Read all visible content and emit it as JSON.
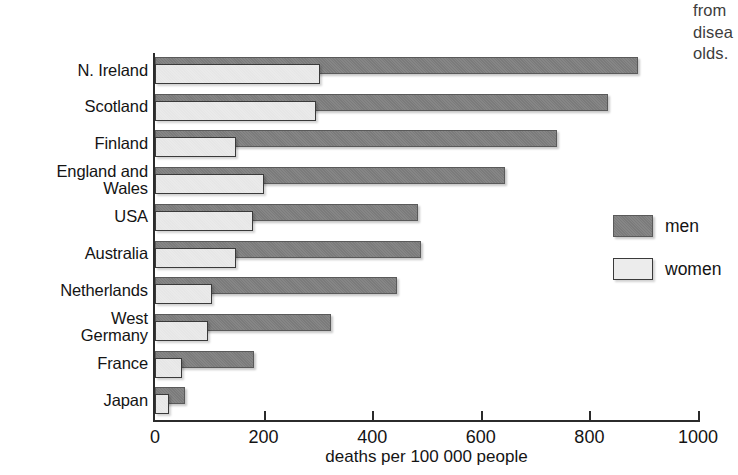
{
  "caption_fragment": {
    "line1": "from",
    "line2": "disea",
    "line3": "olds."
  },
  "legend": {
    "position": "right-middle",
    "items": [
      {
        "label": "men",
        "color": "#7f7f7f",
        "name": "men"
      },
      {
        "label": "women",
        "color": "#ececec",
        "name": "women"
      }
    ]
  },
  "chart_data": {
    "type": "bar",
    "orientation": "horizontal",
    "title": "",
    "subtitle": "",
    "xlabel": "deaths per 100 000 people",
    "ylabel": "",
    "xlim": [
      0,
      1000
    ],
    "ylim": null,
    "grid": false,
    "xticks": [
      0,
      200,
      400,
      600,
      800,
      1000
    ],
    "xtick_labels": [
      "0",
      "200",
      "400",
      "600",
      "800",
      "1000"
    ],
    "legend_position": "right",
    "categories": [
      "N. Ireland",
      "Scotland",
      "Finland",
      "England and Wales",
      "USA",
      "Australia",
      "Netherlands",
      "West Germany",
      "France",
      "Japan"
    ],
    "category_lines": [
      [
        "N. Ireland"
      ],
      [
        "Scotland"
      ],
      [
        "Finland"
      ],
      [
        "England and",
        "Wales"
      ],
      [
        "USA"
      ],
      [
        "Australia"
      ],
      [
        "Netherlands"
      ],
      [
        "West",
        "Germany"
      ],
      [
        "France"
      ],
      [
        "Japan"
      ]
    ],
    "series": [
      {
        "name": "men",
        "color": "#7f7f7f",
        "values": [
          890,
          835,
          740,
          645,
          485,
          490,
          445,
          325,
          182,
          55
        ]
      },
      {
        "name": "women",
        "color": "#ececec",
        "values": [
          303,
          297,
          150,
          200,
          180,
          150,
          105,
          98,
          50,
          25
        ]
      }
    ]
  }
}
